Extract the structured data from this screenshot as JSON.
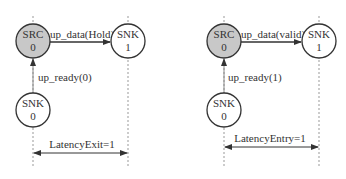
{
  "diagrams": [
    {
      "src": {
        "name": "SRC",
        "state": "0"
      },
      "snk_top": {
        "name": "SNK",
        "state": "1"
      },
      "snk_bottom": {
        "name": "SNK",
        "state": "0"
      },
      "data_msg": "up_data(Hold)",
      "ready_msg": "up_ready(0)",
      "latency": "LatencyExit=1"
    },
    {
      "src": {
        "name": "SRC",
        "state": "0"
      },
      "snk_top": {
        "name": "SNK",
        "state": "1"
      },
      "snk_bottom": {
        "name": "SNK",
        "state": "0"
      },
      "data_msg": "up_data(valid)",
      "ready_msg": "up_ready(1)",
      "latency": "LatencyEntry=1"
    }
  ],
  "colors": {
    "src_fill": "#c8c8c8",
    "node_fill": "#ffffff",
    "stroke": "#333333",
    "dash": "#999999"
  }
}
